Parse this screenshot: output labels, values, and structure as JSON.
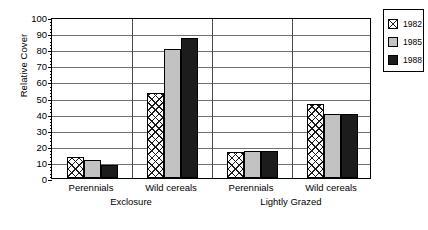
{
  "chart_data": {
    "type": "bar",
    "title": "",
    "xlabel": "",
    "ylabel": "Relative Cover",
    "ylim": [
      0,
      100
    ],
    "ytick_step": 10,
    "yticks": [
      "0",
      "10",
      "20",
      "30",
      "40",
      "50",
      "60",
      "70",
      "80",
      "90",
      "100"
    ],
    "grid": true,
    "legend_position": "right",
    "group_labels": [
      "Exclosure",
      "Lightly Grazed"
    ],
    "categories": [
      "Perennials",
      "Wild cereals",
      "Perennials",
      "Wild cereals"
    ],
    "series": [
      {
        "name": "1982",
        "pattern": "crosshatch",
        "color": "#ffffff",
        "values": [
          13,
          53,
          16,
          46
        ]
      },
      {
        "name": "1985",
        "pattern": "solid",
        "color": "#c2c2c2",
        "values": [
          11,
          80,
          17,
          40
        ]
      },
      {
        "name": "1988",
        "pattern": "solid",
        "color": "#1c1c1c",
        "values": [
          8,
          87,
          17,
          40
        ]
      }
    ]
  },
  "axis": {
    "y_title": "Relative Cover"
  },
  "groups": [
    {
      "panel": "Exclosure",
      "category": "Perennials"
    },
    {
      "panel": "Exclosure",
      "category": "Wild cereals"
    },
    {
      "panel": "Lightly Grazed",
      "category": "Perennials"
    },
    {
      "panel": "Lightly Grazed",
      "category": "Wild cereals"
    }
  ],
  "legend": {
    "items": [
      {
        "label": "1982"
      },
      {
        "label": "1985"
      },
      {
        "label": "1988"
      }
    ]
  }
}
